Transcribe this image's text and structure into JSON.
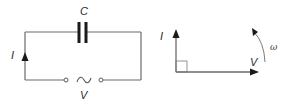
{
  "circuit": {
    "capacitor_label": "C",
    "current_label": "I",
    "source_label": "V",
    "source_symbol": "~"
  },
  "phasor_diagram": {
    "current_label": "I",
    "voltage_label": "V",
    "angular_velocity_label": "ω",
    "angle_marker": "right-angle"
  }
}
